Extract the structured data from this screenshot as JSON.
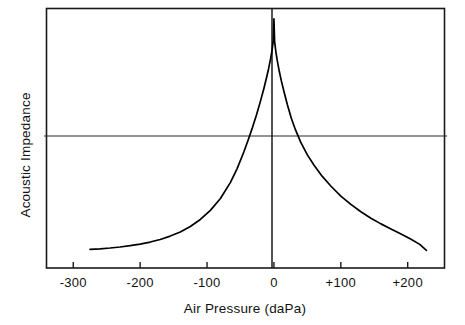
{
  "chart_data": {
    "type": "line",
    "title": "",
    "subtitle": "",
    "xlabel": "Air Pressure (daPa)",
    "ylabel": "Acoustic Impedance",
    "xlim": [
      -340,
      255
    ],
    "ylim": [
      0,
      1
    ],
    "grid": false,
    "legend": null,
    "x_tick_labels": [
      "-300",
      "-200",
      "-100",
      "0",
      "+100",
      "+200"
    ],
    "x_tick_values": [
      -300,
      -200,
      -100,
      0,
      100,
      200
    ],
    "y_tick_labels": [],
    "annotations": [
      {
        "name": "zero-pressure-vertical-line",
        "x": 0,
        "description": "vertical reference line at 0 daPa"
      },
      {
        "name": "impedance-reference-horizontal-line",
        "y": 0.56,
        "description": "horizontal reference line across plot"
      }
    ],
    "series": [
      {
        "name": "Acoustic Impedance",
        "color": "#000000",
        "x": [
          -275,
          -260,
          -245,
          -230,
          -215,
          -200,
          -185,
          -170,
          -155,
          -140,
          -125,
          -110,
          -95,
          -80,
          -65,
          -55,
          -45,
          -38,
          -32,
          -26,
          -20,
          -15,
          -11,
          -8,
          -5,
          -3,
          -1,
          0,
          1,
          3,
          5,
          8,
          11,
          15,
          20,
          26,
          32,
          40,
          50,
          60,
          72,
          85,
          100,
          115,
          130,
          145,
          160,
          175,
          190,
          205,
          218,
          228
        ],
        "y": [
          0.072,
          0.074,
          0.077,
          0.081,
          0.086,
          0.092,
          0.1,
          0.11,
          0.123,
          0.139,
          0.16,
          0.187,
          0.222,
          0.268,
          0.33,
          0.383,
          0.447,
          0.497,
          0.542,
          0.591,
          0.644,
          0.692,
          0.734,
          0.768,
          0.806,
          0.836,
          0.875,
          0.96,
          0.873,
          0.831,
          0.799,
          0.758,
          0.722,
          0.68,
          0.63,
          0.577,
          0.534,
          0.485,
          0.436,
          0.396,
          0.354,
          0.316,
          0.277,
          0.245,
          0.217,
          0.192,
          0.17,
          0.15,
          0.131,
          0.111,
          0.091,
          0.068
        ]
      }
    ]
  },
  "axes": {
    "x_title": "Air Pressure (daPa)",
    "y_title": "Acoustic Impedance",
    "x_ticks": [
      {
        "label": "-300",
        "value": -300
      },
      {
        "label": "-200",
        "value": -200
      },
      {
        "label": "-100",
        "value": -100
      },
      {
        "label": "0",
        "value": 0
      },
      {
        "label": "+100",
        "value": 100
      },
      {
        "label": "+200",
        "value": 200
      }
    ]
  },
  "style": {
    "frame_color": "#1a1a1a",
    "curve_color": "#000000",
    "reference_line_color": "#2a2a2a",
    "background": "#ffffff"
  }
}
